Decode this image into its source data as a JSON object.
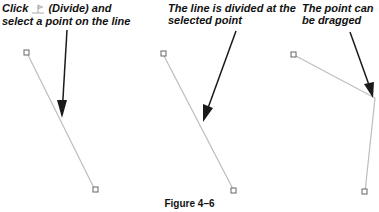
{
  "panels": [
    {
      "caption_before": "Click ",
      "icon": "divide-icon",
      "caption_after": " (Divide) and select a point on the line"
    },
    {
      "caption": "The line is divided at the selected point"
    },
    {
      "caption": "The point can be dragged"
    }
  ],
  "figure_label": "Figure 4–6",
  "colors": {
    "line": "#bdbdbd",
    "arrow": "#1a1a1a",
    "handle": "#666666"
  }
}
